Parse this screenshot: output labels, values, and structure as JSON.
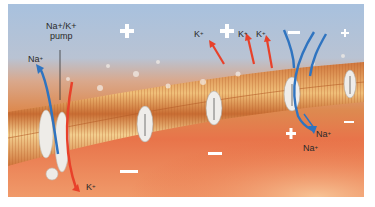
{
  "figure": {
    "colors": {
      "extracellular_top": "#a9c2de",
      "extracellular_bottom": "#c9b9b6",
      "membrane_outer": "#d97a3f",
      "membrane_core": "#f2c98a",
      "intracellular": "#e8643a",
      "intracellular_light": "#f5b07a",
      "k_arrow": "#e8412a",
      "na_arrow": "#2f74c0",
      "channel": "#eeeeec"
    },
    "labels": {
      "pump": "Na+/K+\npump",
      "pump_line1": "Na+/K+",
      "pump_line2": "pump",
      "na_out_left": "Na",
      "k_in_bottom": "K",
      "k_top_1": "K",
      "k_top_2": "K",
      "k_top_3": "K",
      "na_in_1": "Na",
      "na_in_2": "Na",
      "plus_sup": "+"
    },
    "charges": {
      "outside": [
        "+",
        "+",
        "−",
        "+"
      ],
      "inside": [
        "−",
        "−",
        "+",
        "−"
      ]
    }
  }
}
